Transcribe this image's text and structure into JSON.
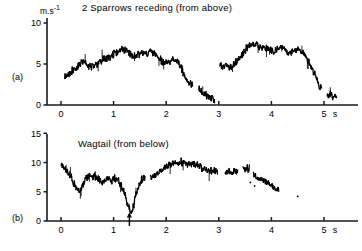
{
  "figure": {
    "background_color": "#ffffff",
    "trace_color": "#000000",
    "axis_color": "#1a1a1a"
  },
  "panels": [
    {
      "letter": "(a)",
      "title": "2 Sparrows receding (from above)",
      "y_unit": "m.s",
      "y_unit_exponent": "-1",
      "x_unit": "s",
      "y_ticks": [
        "0",
        "5",
        "10"
      ],
      "x_ticks": [
        "0",
        "1",
        "2",
        "3",
        "4",
        "5"
      ]
    },
    {
      "letter": "(b)",
      "title": "Wagtail (from below)",
      "y_unit": "",
      "y_unit_exponent": "",
      "x_unit": "s",
      "y_ticks": [
        "0",
        "5",
        "10",
        "15"
      ],
      "x_ticks": [
        "0",
        "1",
        "2",
        "3",
        "4",
        "5"
      ],
      "marker_label": "arrow-marker"
    }
  ],
  "chart_data": [
    {
      "type": "line",
      "title": "2 Sparrows receding (from above)",
      "xlabel": "s",
      "ylabel": "m.s-1",
      "xlim": [
        -0.15,
        5.6
      ],
      "ylim": [
        0,
        10.8
      ],
      "xticks": [
        0,
        1,
        2,
        3,
        4,
        5
      ],
      "yticks": [
        0,
        5,
        10
      ],
      "grid": false,
      "legend": "none",
      "noise_amplitude": 0.55,
      "segments": [
        {
          "name": "main-flight-trace",
          "x": [
            0.07,
            0.14,
            0.22,
            0.3,
            0.38,
            0.42,
            0.48,
            0.55,
            0.62,
            0.7,
            0.78,
            0.86,
            0.94,
            1.02,
            1.1,
            1.18,
            1.24,
            1.3,
            1.38,
            1.46,
            1.54,
            1.62,
            1.7,
            1.78,
            1.86,
            1.94,
            2.02,
            2.08,
            2.14,
            2.2,
            2.26,
            2.32,
            2.38,
            2.44,
            2.5
          ],
          "y": [
            3.5,
            3.6,
            4.2,
            4.5,
            5.1,
            5.4,
            4.9,
            4.6,
            4.7,
            5.0,
            5.4,
            5.7,
            5.9,
            6.2,
            6.6,
            6.9,
            6.7,
            6.3,
            5.9,
            6.2,
            6.4,
            6.1,
            6.5,
            6.3,
            5.7,
            5.2,
            5.4,
            5.1,
            5.5,
            5.3,
            4.8,
            4.0,
            3.2,
            2.7,
            2.6
          ]
        },
        {
          "name": "descent-fragment",
          "x": [
            2.62,
            2.7,
            2.78,
            2.86,
            2.92
          ],
          "y": [
            1.9,
            1.5,
            1.1,
            0.8,
            0.6
          ]
        },
        {
          "name": "second-climb-trace",
          "x": [
            3.02,
            3.08,
            3.14,
            3.2,
            3.26,
            3.32,
            3.4,
            3.48,
            3.56,
            3.64,
            3.72,
            3.8,
            3.88,
            3.96,
            4.04,
            4.12,
            4.2,
            4.28,
            4.36,
            4.44,
            4.52,
            4.6,
            4.68,
            4.76,
            4.84,
            4.9,
            4.96
          ],
          "y": [
            4.9,
            4.6,
            5.0,
            4.4,
            4.8,
            5.2,
            5.8,
            6.5,
            7.1,
            7.5,
            7.3,
            7.0,
            7.2,
            6.8,
            6.5,
            6.9,
            7.1,
            6.7,
            6.3,
            6.6,
            6.9,
            6.4,
            5.6,
            4.7,
            3.6,
            2.6,
            1.8
          ]
        },
        {
          "name": "tail-fragment",
          "x": [
            5.06,
            5.12,
            5.18,
            5.24
          ],
          "y": [
            1.1,
            1.3,
            1.0,
            1.2
          ]
        }
      ]
    },
    {
      "type": "line",
      "title": "Wagtail (from below)",
      "xlabel": "s",
      "ylabel": "m.s-1",
      "xlim": [
        -0.15,
        5.6
      ],
      "ylim": [
        0,
        16.2
      ],
      "xticks": [
        0,
        1,
        2,
        3,
        4,
        5
      ],
      "yticks": [
        0,
        5,
        10,
        15
      ],
      "grid": false,
      "legend": "none",
      "noise_amplitude": 0.75,
      "marker_x": 1.3,
      "segments": [
        {
          "name": "main-flight-trace",
          "x": [
            0.0,
            0.06,
            0.12,
            0.18,
            0.24,
            0.3,
            0.36,
            0.42,
            0.48,
            0.54,
            0.6,
            0.66,
            0.72,
            0.78,
            0.84,
            0.9,
            0.96,
            1.02,
            1.08,
            1.14,
            1.2,
            1.26,
            1.3,
            1.34,
            1.38,
            1.42,
            1.48,
            1.54,
            1.6
          ],
          "y": [
            9.5,
            9.0,
            8.2,
            7.6,
            6.6,
            5.6,
            5.2,
            6.2,
            7.2,
            7.6,
            7.8,
            7.5,
            7.0,
            6.6,
            6.9,
            7.2,
            7.0,
            7.4,
            7.1,
            6.2,
            4.8,
            3.2,
            1.8,
            1.5,
            2.6,
            4.4,
            6.2,
            7.2,
            7.6
          ]
        },
        {
          "name": "second-climb-trace",
          "x": [
            1.7,
            1.78,
            1.86,
            1.94,
            2.02,
            2.1,
            2.18,
            2.26,
            2.34,
            2.42,
            2.5,
            2.58,
            2.66,
            2.74,
            2.82,
            2.9,
            2.98
          ],
          "y": [
            7.6,
            7.8,
            8.4,
            9.0,
            9.4,
            9.7,
            9.9,
            10.1,
            10.0,
            9.8,
            9.9,
            9.6,
            9.2,
            8.8,
            8.6,
            8.5,
            8.4
          ]
        },
        {
          "name": "sparse-fragment-one",
          "x": [
            3.12,
            3.2,
            3.28,
            3.36
          ],
          "y": [
            8.2,
            8.5,
            8.3,
            8.6
          ]
        },
        {
          "name": "sparse-fragment-two",
          "x": [
            3.46,
            3.52,
            3.58
          ],
          "y": [
            9.0,
            8.8,
            9.1
          ]
        },
        {
          "name": "final-descent",
          "x": [
            3.66,
            3.74,
            3.82,
            3.9,
            3.98,
            4.06,
            4.14
          ],
          "y": [
            7.8,
            7.4,
            7.0,
            6.6,
            6.2,
            5.6,
            5.0
          ]
        },
        {
          "name": "isolated-points",
          "x": [
            3.6,
            3.68,
            4.5
          ],
          "y": [
            6.6,
            6.0,
            4.2
          ]
        }
      ]
    }
  ]
}
